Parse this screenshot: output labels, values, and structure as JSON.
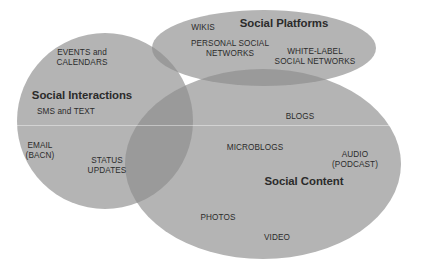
{
  "diagram": {
    "type": "venn",
    "background_color": "#ffffff",
    "set_fill_color": "#b4b4b4",
    "overlap_fill_color": "#9a9a9a",
    "text_color": "#2b2b2b",
    "sets": [
      {
        "id": "social-interactions",
        "title": "Social Interactions",
        "title_x": 82,
        "title_y": 95,
        "shape": "circle",
        "cx": 105,
        "cy": 121,
        "rx": 88,
        "ry": 88,
        "items": [
          {
            "label": "EVENTS and\nCALENDARS",
            "x": 82,
            "y": 54
          },
          {
            "label": "SMS and TEXT",
            "x": 66,
            "y": 112
          },
          {
            "label": "EMAIL\n(BACN)",
            "x": 40,
            "y": 147
          },
          {
            "label": "STATUS\nUPDATES",
            "x": 107,
            "y": 162
          }
        ]
      },
      {
        "id": "social-platforms",
        "title": "Social Platforms",
        "title_x": 284,
        "title_y": 24,
        "shape": "ellipse",
        "cx": 264,
        "cy": 48,
        "rx": 112,
        "ry": 38,
        "items": [
          {
            "label": "WIKIS",
            "x": 203,
            "y": 28
          },
          {
            "label": "PERSONAL SOCIAL\nNETWORKS",
            "x": 230,
            "y": 45
          },
          {
            "label": "WHITE-LABEL\nSOCIAL NETWORKS",
            "x": 315,
            "y": 53
          }
        ]
      },
      {
        "id": "social-content",
        "title": "Social Content",
        "title_x": 304,
        "title_y": 181,
        "shape": "ellipse",
        "cx": 263,
        "cy": 164,
        "rx": 138,
        "ry": 95,
        "items": [
          {
            "label": "BLOGS",
            "x": 300,
            "y": 117
          },
          {
            "label": "MICROBLOGS",
            "x": 255,
            "y": 148
          },
          {
            "label": "AUDIO\n(PODCAST)",
            "x": 355,
            "y": 156
          },
          {
            "label": "PHOTOS",
            "x": 218,
            "y": 218
          },
          {
            "label": "VIDEO",
            "x": 277,
            "y": 238
          }
        ]
      }
    ],
    "scanline_y": 125
  }
}
